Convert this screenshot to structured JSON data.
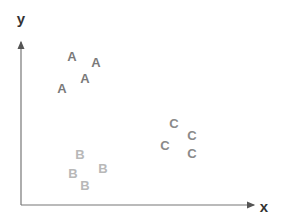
{
  "diagram": {
    "type": "scatter-clusters",
    "axes": {
      "x_label": "x",
      "y_label": "y",
      "color": "#777777"
    },
    "clusters": [
      {
        "label": "A",
        "color": "#7a7a7a",
        "points": [
          [
            72,
            56
          ],
          [
            96,
            62
          ],
          [
            85,
            78
          ],
          [
            62,
            88
          ]
        ]
      },
      {
        "label": "B",
        "color": "#b8b8b8",
        "points": [
          [
            80,
            154
          ],
          [
            103,
            168
          ],
          [
            73,
            173
          ],
          [
            85,
            185
          ]
        ]
      },
      {
        "label": "C",
        "color": "#8a8a8a",
        "points": [
          [
            174,
            123
          ],
          [
            192,
            135
          ],
          [
            165,
            145
          ],
          [
            192,
            153
          ]
        ]
      }
    ]
  }
}
